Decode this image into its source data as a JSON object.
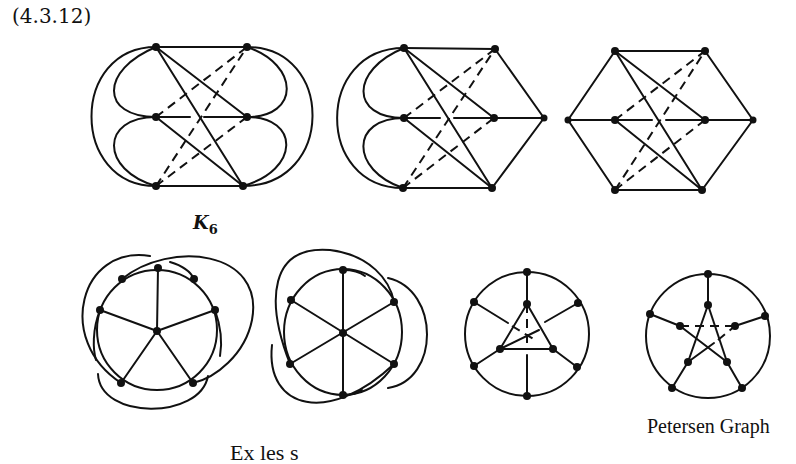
{
  "equation_number": "(4.3.12)",
  "labels": {
    "k6_base": "K",
    "k6_sub": "6",
    "petersen": "Petersen Graph",
    "caption_cut": "Ex  les      s"
  },
  "figures": [
    {
      "id": "k6-drawing-1",
      "row": 1,
      "description": "K6 drawn with 3 crossings (dashed) and outer arcs"
    },
    {
      "id": "k6-drawing-2",
      "row": 1,
      "description": "Graph with 7 vertices, left outer arcs"
    },
    {
      "id": "k6-drawing-3",
      "row": 1,
      "description": "Hexagonal graph with 8 vertices"
    },
    {
      "id": "wheel-like-1",
      "row": 2,
      "description": "Cycle with spokes and outer arcs (5 spokes)"
    },
    {
      "id": "wheel-like-2",
      "row": 2,
      "description": "Wheel with 6 spokes and outer arcs"
    },
    {
      "id": "triangle-in-circle",
      "row": 2,
      "description": "Circle with inner triangle"
    },
    {
      "id": "petersen-graph",
      "row": 2,
      "description": "Petersen Graph"
    }
  ]
}
